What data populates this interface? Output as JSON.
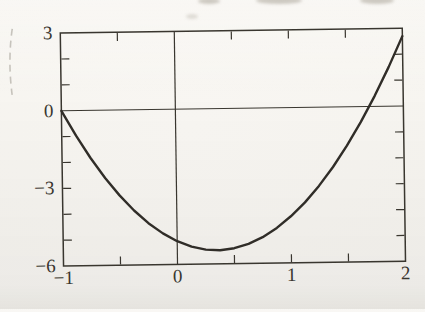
{
  "colors": {
    "paper": "#f6f4ef",
    "ink": "#39362f",
    "curve_ink": "#302d28",
    "artifact": "#b5b1a9",
    "smudge": "#cdc9c1"
  },
  "chart_data": {
    "type": "line",
    "title": "",
    "xlabel": "",
    "ylabel": "",
    "xlim": [
      -1,
      2
    ],
    "ylim": [
      -6,
      3
    ],
    "grid": false,
    "framed_box": true,
    "axes_through_origin": true,
    "legend": "none",
    "x_tick_labels": [
      {
        "value": -1,
        "label": "−1"
      },
      {
        "value": 0,
        "label": "0"
      },
      {
        "value": 1,
        "label": "1"
      },
      {
        "value": 2,
        "label": "2"
      }
    ],
    "y_tick_labels": [
      {
        "value": 3,
        "label": "3"
      },
      {
        "value": 0,
        "label": "0"
      },
      {
        "value": -3,
        "label": "−3"
      },
      {
        "value": -6,
        "label": "−6"
      }
    ],
    "x_tick_marks": [
      -0.5,
      0.5,
      1,
      1.5
    ],
    "y_tick_marks": [
      -5,
      -4,
      -3,
      -2,
      -1,
      1,
      2
    ],
    "series": [
      {
        "name": "parabola-curve",
        "x": [
          -1,
          -0.875,
          -0.75,
          -0.625,
          -0.5,
          -0.375,
          -0.25,
          -0.125,
          0,
          0.125,
          0.25,
          0.375,
          0.5,
          0.625,
          0.75,
          0.875,
          1,
          1.125,
          1.25,
          1.375,
          1.5,
          1.625,
          1.75,
          1.875,
          2
        ],
        "y": [
          0,
          -0.97,
          -1.84,
          -2.62,
          -3.3,
          -3.89,
          -4.39,
          -4.79,
          -5.1,
          -5.32,
          -5.44,
          -5.47,
          -5.4,
          -5.24,
          -4.99,
          -4.64,
          -4.2,
          -3.67,
          -3.04,
          -2.32,
          -1.5,
          -0.59,
          0.41,
          1.51,
          2.7
        ]
      }
    ],
    "curve_key_features": {
      "roots_x": [
        -1,
        1.7
      ],
      "minimum_point": [
        0.35,
        -5.47
      ],
      "value_at_x0": -5.1,
      "value_at_x2": 2.7
    }
  }
}
